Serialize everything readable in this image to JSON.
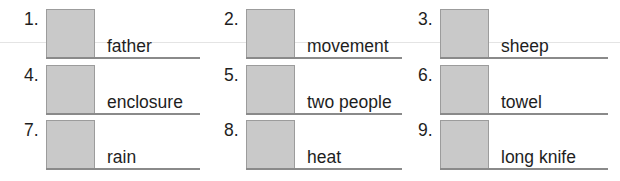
{
  "items": [
    {
      "number": "1.",
      "label": "father"
    },
    {
      "number": "2.",
      "label": "movement"
    },
    {
      "number": "3.",
      "label": "sheep"
    },
    {
      "number": "4.",
      "label": "enclosure"
    },
    {
      "number": "5.",
      "label": "two people"
    },
    {
      "number": "6.",
      "label": "towel"
    },
    {
      "number": "7.",
      "label": "rain"
    },
    {
      "number": "8.",
      "label": "heat"
    },
    {
      "number": "9.",
      "label": "long knife"
    }
  ],
  "colors": {
    "box_fill": "#c9c9c9",
    "box_border": "#9c9c9c",
    "underline": "#8a8a8a",
    "text": "#1e1e1e"
  }
}
